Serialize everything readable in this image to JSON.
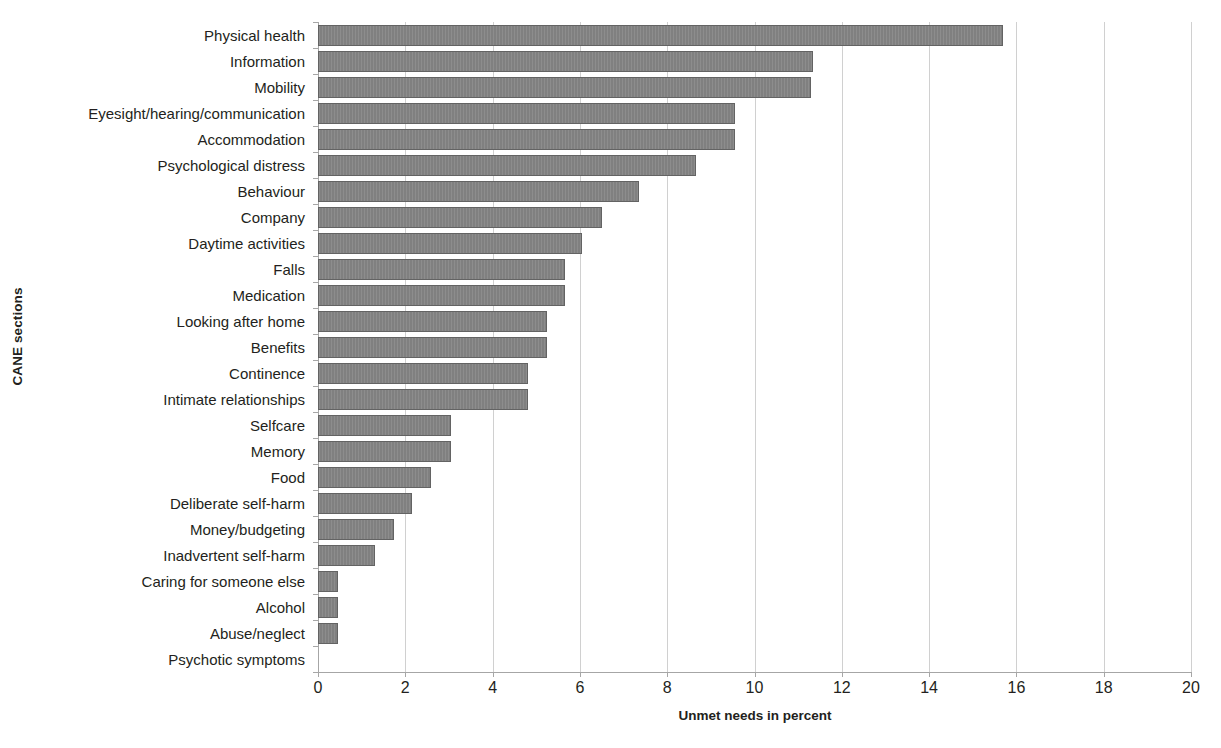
{
  "chart_data": {
    "type": "bar",
    "orientation": "horizontal",
    "title": "",
    "xlabel": "Unmet needs in percent",
    "ylabel": "CANE sections",
    "xlim": [
      0,
      20
    ],
    "xticks": [
      0,
      2,
      4,
      6,
      8,
      10,
      12,
      14,
      16,
      18,
      20
    ],
    "grid": true,
    "legend": false,
    "bar_color": "#808080",
    "bar_border_color": "#636363",
    "gridline_color": "#d0d0d0",
    "axis_color": "#a6a6a6",
    "categories": [
      "Physical health",
      "Information",
      "Mobility",
      "Eyesight/hearing/communication",
      "Accommodation",
      "Psychological distress",
      "Behaviour",
      "Company",
      "Daytime activities",
      "Falls",
      "Medication",
      "Looking after home",
      "Benefits",
      "Continence",
      "Intimate relationships",
      "Selfcare",
      "Memory",
      "Food",
      "Deliberate self-harm",
      "Money/budgeting",
      "Inadvertent self-harm",
      "Caring for someone else",
      "Alcohol",
      "Abuse/neglect",
      "Psychotic symptoms"
    ],
    "values": [
      15.7,
      11.35,
      11.3,
      9.55,
      9.55,
      8.65,
      7.35,
      6.5,
      6.05,
      5.65,
      5.65,
      5.25,
      5.25,
      4.8,
      4.8,
      3.05,
      3.05,
      2.6,
      2.15,
      1.75,
      1.3,
      0.45,
      0.45,
      0.45,
      0.0
    ]
  }
}
